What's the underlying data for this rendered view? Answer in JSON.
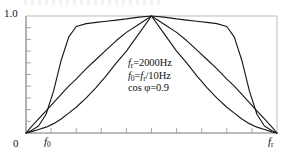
{
  "figure": {
    "title": "",
    "annotation": {
      "line1": {
        "var": "f",
        "sub": "r",
        "eq": "=2000Hz"
      },
      "line2": {
        "var": "f",
        "sub": "0",
        "eq": "=",
        "var2": "f",
        "sub2": "r",
        "eq2": "/10Hz"
      },
      "line3": {
        "text": "cos φ=0.9"
      }
    },
    "axis": {
      "y_top_label": "1.0",
      "y_bottom_label": "0",
      "x_zero_label": "0",
      "x_f0_var": "f",
      "x_f0_sub": "0",
      "x_fr_var": "f",
      "x_fr_sub": "r"
    },
    "colors": {
      "curve": "#1a1a1a",
      "frame": "#9a9a9a",
      "tick": "#8f8f8f",
      "background": "#ffffff"
    }
  },
  "chart_data": {
    "type": "line",
    "title": "",
    "xlabel": "",
    "ylabel": "",
    "xlim": [
      0,
      2000
    ],
    "ylim": [
      0,
      1.0
    ],
    "x_tick_labels": [
      "0",
      "f0",
      "fr"
    ],
    "y_tick_labels": [
      "0",
      "1.0"
    ],
    "grid": false,
    "legend": "none",
    "annotations": [
      "fr=2000Hz",
      "f0=fr/10Hz",
      "cos φ=0.9"
    ],
    "x": [
      0,
      0.02,
      0.05,
      0.08,
      0.11,
      0.14,
      0.17,
      0.2,
      0.24,
      0.28,
      0.32,
      0.36,
      0.4,
      0.45,
      0.5,
      0.55,
      0.6,
      0.64,
      0.68,
      0.72,
      0.76,
      0.8,
      0.83,
      0.86,
      0.89,
      0.92,
      0.95,
      0.98,
      1.0
    ],
    "series": [
      {
        "name": "curve-1-flat-top",
        "values": [
          0.0,
          0.02,
          0.06,
          0.16,
          0.36,
          0.62,
          0.82,
          0.91,
          0.935,
          0.945,
          0.955,
          0.965,
          0.975,
          0.99,
          1.0,
          0.99,
          0.975,
          0.965,
          0.955,
          0.945,
          0.935,
          0.91,
          0.82,
          0.62,
          0.36,
          0.16,
          0.06,
          0.02,
          0.0
        ]
      },
      {
        "name": "curve-2-linear-ramp",
        "values": [
          0.0,
          0.05,
          0.12,
          0.19,
          0.26,
          0.33,
          0.4,
          0.46,
          0.55,
          0.63,
          0.71,
          0.79,
          0.86,
          0.93,
          1.0,
          0.93,
          0.86,
          0.79,
          0.71,
          0.63,
          0.55,
          0.46,
          0.4,
          0.33,
          0.26,
          0.19,
          0.12,
          0.05,
          0.0
        ]
      },
      {
        "name": "curve-3-rounded",
        "values": [
          0.0,
          0.01,
          0.03,
          0.05,
          0.08,
          0.12,
          0.17,
          0.22,
          0.3,
          0.39,
          0.49,
          0.6,
          0.7,
          0.85,
          1.0,
          0.85,
          0.7,
          0.6,
          0.49,
          0.39,
          0.3,
          0.22,
          0.17,
          0.12,
          0.08,
          0.05,
          0.03,
          0.01,
          0.0
        ]
      }
    ]
  }
}
